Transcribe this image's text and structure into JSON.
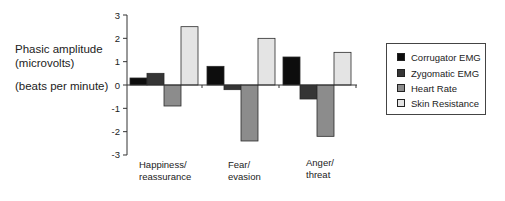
{
  "chart_data": {
    "type": "bar",
    "title": "",
    "ylabel_lines": [
      "Phasic amplitude",
      "(microvolts)",
      "(beats per minute)"
    ],
    "xlabel": "",
    "categories": [
      "Happiness/\nreassurance",
      "Fear/\nevasion",
      "Anger/\nthreat"
    ],
    "category_lines": [
      [
        "Happiness/",
        "reassurance"
      ],
      [
        "Fear/",
        "evasion"
      ],
      [
        "Anger/",
        "threat"
      ]
    ],
    "yticks": [
      3,
      2,
      1,
      0,
      -1,
      -2,
      -3
    ],
    "ylim": [
      -3,
      3
    ],
    "grid": false,
    "legend_position": "right",
    "series": [
      {
        "name": "Corrugator EMG",
        "color": "#0d0d0d",
        "values": [
          0.3,
          0.8,
          1.2
        ]
      },
      {
        "name": "Zygomatic EMG",
        "color": "#353535",
        "values": [
          0.5,
          -0.2,
          -0.6
        ]
      },
      {
        "name": "Heart Rate",
        "color": "#8c8c8c",
        "values": [
          -0.9,
          -2.4,
          -2.2
        ]
      },
      {
        "name": "Skin Resistance",
        "color": "#e4e4e4",
        "values": [
          2.5,
          2.0,
          1.4
        ]
      }
    ]
  },
  "labels": {
    "y1": "Phasic amplitude",
    "y2": "(microvolts)",
    "y3": "(beats per minute)",
    "cat0a": "Happiness/",
    "cat0b": "reassurance",
    "cat1a": "Fear/",
    "cat1b": "evasion",
    "cat2a": "Anger/",
    "cat2b": "threat"
  },
  "legend": [
    {
      "label": "Corrugator EMG",
      "color": "#0d0d0d"
    },
    {
      "label": "Zygomatic EMG",
      "color": "#353535"
    },
    {
      "label": "Heart Rate",
      "color": "#8c8c8c"
    },
    {
      "label": "Skin Resistance",
      "color": "#e4e4e4"
    }
  ]
}
